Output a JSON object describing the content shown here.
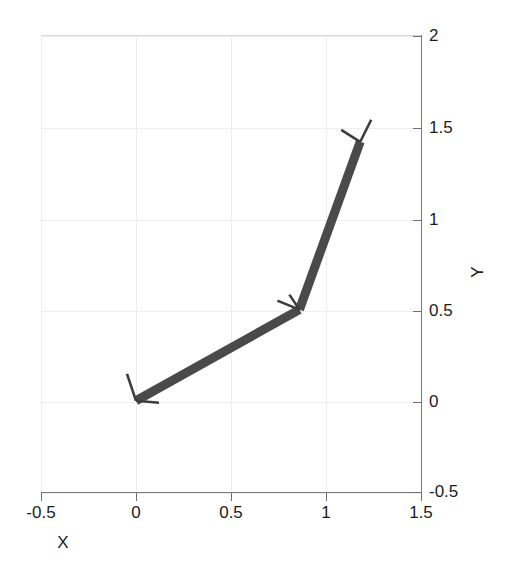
{
  "figure": {
    "width": 511,
    "height": 564,
    "background": "#ffffff"
  },
  "axis": {
    "xlabel": "X",
    "ylabel": "Y",
    "x_ticks": [
      "-0.5",
      "0",
      "0.5",
      "1",
      "1.5"
    ],
    "y_ticks": [
      "2",
      "1.5",
      "1",
      "0.5",
      "0",
      "-0.5"
    ],
    "y_axis_side": "right",
    "x_axis_side": "bottom"
  },
  "colors": {
    "link": "#4a4a4a",
    "frame_marker": "#3d3d3d",
    "grid": "#eeeef1",
    "axis": "#7a7a7e",
    "text": "#1c1c1c"
  },
  "chart_data": {
    "type": "line",
    "title": "",
    "xlabel": "X",
    "ylabel": "Y",
    "xlim": [
      -0.5,
      1.5
    ],
    "ylim": [
      -0.5,
      2
    ],
    "xticks": [
      -0.5,
      0,
      0.5,
      1,
      1.5
    ],
    "yticks": [
      -0.5,
      0,
      0.5,
      1,
      1.5,
      2
    ],
    "grid": true,
    "legend": "none",
    "series": [
      {
        "name": "robot-arm-links",
        "x": [
          0.0,
          0.86,
          1.18
        ],
        "y": [
          0.0,
          0.5,
          1.42
        ]
      }
    ],
    "joints": [
      {
        "name": "base",
        "x": 0.0,
        "y": 0.0
      },
      {
        "name": "elbow",
        "x": 0.86,
        "y": 0.5
      },
      {
        "name": "end-effector",
        "x": 1.18,
        "y": 1.42
      }
    ]
  }
}
